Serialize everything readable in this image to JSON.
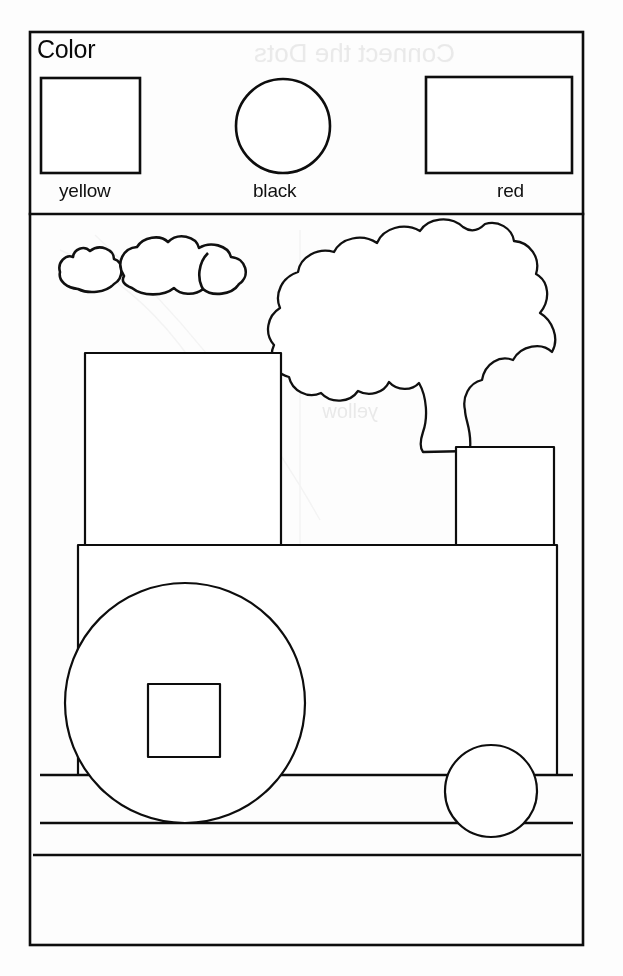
{
  "page": {
    "title": "Color",
    "background_color": "#ffffff",
    "ink_color": "#0d0d0d",
    "width": 623,
    "height": 976
  },
  "header": {
    "heading": "Color",
    "swatches": [
      {
        "label": "yellow",
        "shape": "square",
        "fill": "#ffffff"
      },
      {
        "label": "black",
        "shape": "circle",
        "fill": "#ffffff"
      },
      {
        "label": "red",
        "shape": "rectangle",
        "fill": "#ffffff"
      }
    ]
  },
  "drawing": {
    "subject": "steam-train",
    "parts": [
      {
        "name": "small-cloud-left",
        "shape": "cloud"
      },
      {
        "name": "large-cloud",
        "shape": "cloud"
      },
      {
        "name": "smoke-plume",
        "shape": "billowing-smoke"
      },
      {
        "name": "cab",
        "shape": "square"
      },
      {
        "name": "chimney",
        "shape": "rectangle"
      },
      {
        "name": "body",
        "shape": "rectangle"
      },
      {
        "name": "large-wheel",
        "shape": "circle"
      },
      {
        "name": "wheel-hub",
        "shape": "square"
      },
      {
        "name": "small-wheel",
        "shape": "circle"
      },
      {
        "name": "track",
        "shape": "lines"
      }
    ]
  },
  "bleed_through": {
    "note": "faint mirrored text showing through from the reverse side of the page",
    "lines": [
      {
        "text": "Connect the Dots",
        "x": 300,
        "y": 55
      },
      {
        "text": "picture of",
        "x": 470,
        "y": 100
      },
      {
        "text": "Color",
        "x": 470,
        "y": 140
      },
      {
        "text": "blue",
        "x": 170,
        "y": 400
      },
      {
        "text": "yellow",
        "x": 370,
        "y": 400
      }
    ]
  }
}
